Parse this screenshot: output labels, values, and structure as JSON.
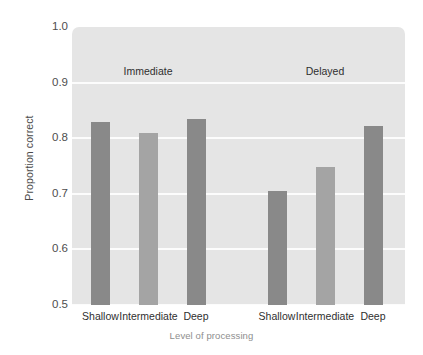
{
  "chart_data": {
    "type": "bar",
    "title": "",
    "xlabel": "Level of processing",
    "ylabel": "Proportion correct",
    "ylim": [
      0.5,
      1.0
    ],
    "ytick_labels": [
      "1.0",
      "0.9",
      "0.8",
      "0.7",
      "0.6",
      "0.5"
    ],
    "ytick_values": [
      1.0,
      0.9,
      0.8,
      0.7,
      0.6,
      0.5
    ],
    "grid": true,
    "legend": "none",
    "categories": [
      "Shallow",
      "Intermediate",
      "Deep"
    ],
    "group_labels": [
      "Immediate",
      "Delayed"
    ],
    "series": [
      {
        "name": "Immediate",
        "values": [
          0.83,
          0.81,
          0.835
        ]
      },
      {
        "name": "Delayed",
        "values": [
          0.705,
          0.748,
          0.822
        ]
      }
    ],
    "bars": [
      {
        "group": "Immediate",
        "category": "Shallow",
        "value": 0.83,
        "shade": "dark"
      },
      {
        "group": "Immediate",
        "category": "Intermediate",
        "value": 0.81,
        "shade": "light"
      },
      {
        "group": "Immediate",
        "category": "Deep",
        "value": 0.835,
        "shade": "dark"
      },
      {
        "group": "Delayed",
        "category": "Shallow",
        "value": 0.705,
        "shade": "dark"
      },
      {
        "group": "Delayed",
        "category": "Intermediate",
        "value": 0.748,
        "shade": "light"
      },
      {
        "group": "Delayed",
        "category": "Deep",
        "value": 0.822,
        "shade": "dark"
      }
    ],
    "colors": {
      "bar_dark": "#898989",
      "bar_light": "#a4a4a4",
      "plot_background": "#e5e5e5",
      "gridline": "#fcfcfc",
      "page_background": "#ffffff",
      "tick_text": "#4e4e4e",
      "axis_title_x": "#8e8e8e",
      "axis_title_y": "#4a4a4a"
    }
  }
}
